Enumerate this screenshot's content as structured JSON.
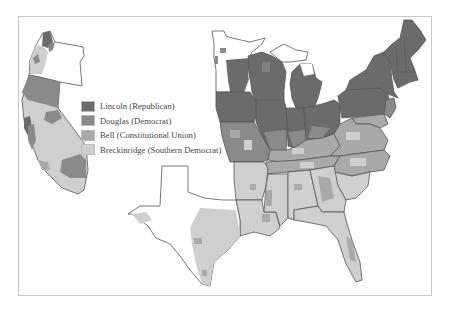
{
  "map": {
    "subject": "1860 U.S. presidential election results by county",
    "colors": {
      "lincoln": "#6b6b6b",
      "douglas": "#8a8a8a",
      "bell": "#a9a9a9",
      "breckinridge": "#cfcfcf",
      "no_data": "#ffffff",
      "border": "#555555",
      "frame": "#c8c8c8"
    }
  },
  "legend": {
    "items": [
      {
        "key": "lincoln",
        "label": "Lincoln (Republican)",
        "color": "#6b6b6b"
      },
      {
        "key": "douglas",
        "label": "Douglas (Democrat)",
        "color": "#8a8a8a"
      },
      {
        "key": "bell",
        "label": "Bell (Constitutional Union)",
        "color": "#a9a9a9"
      },
      {
        "key": "breckinridge",
        "label": "Breckinridge (Southern Democrat)",
        "color": "#cfcfcf"
      }
    ]
  }
}
